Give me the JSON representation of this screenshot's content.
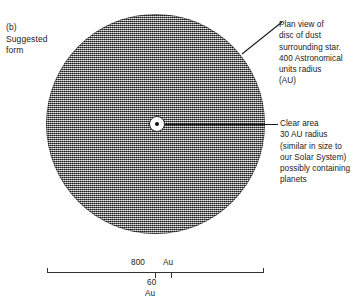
{
  "figure": {
    "label": "(b)\nSuggested\nform"
  },
  "annotations": {
    "plan_view": "Plan view of\ndisc of dust\nsurrounding star.\n400 Astronomical\nunits radius\n(AU)",
    "clear_area": "Clear area\n30 AU radius\n(similar in size to\nour Solar System)\npossibly containing\nplanets"
  },
  "diagram": {
    "disc_name": "dust-disc",
    "disc_fill": "#8d8d8d",
    "clear_area_name": "clear-area",
    "star_name": "central-star",
    "line_color": "#151515"
  },
  "scale": {
    "label_800": "800",
    "label_au_top": "Au",
    "label_60": "60",
    "label_au_bottom": "Au"
  }
}
